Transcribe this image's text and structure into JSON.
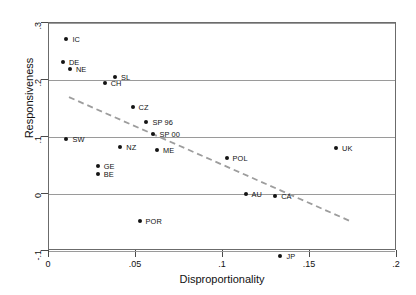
{
  "chart_data": {
    "type": "scatter",
    "title": "",
    "xlabel": "Disproportionality",
    "ylabel": "Responsiveness",
    "xlim": [
      0,
      0.2
    ],
    "ylim": [
      -0.1,
      0.3
    ],
    "xticks": [
      "0",
      ".05",
      ".1",
      ".15",
      ".2"
    ],
    "xtickvalues": [
      0,
      0.05,
      0.1,
      0.15,
      0.2
    ],
    "yticks": [
      ".3",
      ".2",
      ".1",
      "0",
      "-.1"
    ],
    "ytickvalues": [
      0.3,
      0.2,
      0.1,
      0,
      -0.1
    ],
    "grid": "horizontal",
    "legend": "none",
    "points": [
      {
        "label": "IC",
        "x": 0.01,
        "y": 0.272,
        "lx": 6,
        "ly": -3
      },
      {
        "label": "DE",
        "x": 0.008,
        "y": 0.232,
        "lx": 6,
        "ly": -3
      },
      {
        "label": "NE",
        "x": 0.012,
        "y": 0.22,
        "lx": 6,
        "ly": -3
      },
      {
        "label": "SL",
        "x": 0.038,
        "y": 0.206,
        "lx": 6,
        "ly": -3
      },
      {
        "label": "CH",
        "x": 0.032,
        "y": 0.194,
        "lx": 6,
        "ly": -3
      },
      {
        "label": "CZ",
        "x": 0.048,
        "y": 0.153,
        "lx": 6,
        "ly": -3
      },
      {
        "label": "SP 96",
        "x": 0.056,
        "y": 0.126,
        "lx": 6,
        "ly": -3
      },
      {
        "label": "SP 00",
        "x": 0.06,
        "y": 0.106,
        "lx": 6,
        "ly": -3
      },
      {
        "label": "SW",
        "x": 0.01,
        "y": 0.096,
        "lx": 6,
        "ly": -3
      },
      {
        "label": "NZ",
        "x": 0.041,
        "y": 0.082,
        "lx": 6,
        "ly": -3
      },
      {
        "label": "ME",
        "x": 0.062,
        "y": 0.078,
        "lx": 6,
        "ly": -3
      },
      {
        "label": "GE",
        "x": 0.028,
        "y": 0.049,
        "lx": 6,
        "ly": -3
      },
      {
        "label": "BE",
        "x": 0.028,
        "y": 0.035,
        "lx": 6,
        "ly": -3
      },
      {
        "label": "POL",
        "x": 0.102,
        "y": 0.064,
        "lx": 6,
        "ly": -3
      },
      {
        "label": "UK",
        "x": 0.165,
        "y": 0.08,
        "lx": 6,
        "ly": -3
      },
      {
        "label": "AU",
        "x": 0.113,
        "y": 0.0,
        "lx": 6,
        "ly": -3
      },
      {
        "label": "CA",
        "x": 0.13,
        "y": -0.004,
        "lx": 6,
        "ly": -3
      },
      {
        "label": "POR",
        "x": 0.052,
        "y": -0.047,
        "lx": 6,
        "ly": -3
      },
      {
        "label": "JP",
        "x": 0.133,
        "y": -0.108,
        "lx": 6,
        "ly": -3
      }
    ],
    "trendline": {
      "style": "dashed",
      "color": "#9d9d9d",
      "x0": 0.0115,
      "y0": 0.17,
      "x1": 0.1735,
      "y1": -0.048
    }
  }
}
